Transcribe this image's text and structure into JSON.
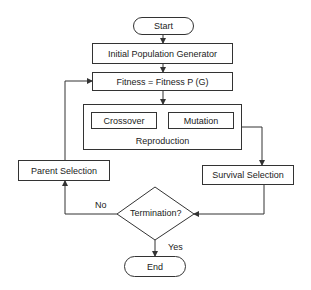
{
  "diagram": {
    "type": "flowchart",
    "nodes": {
      "start": "Start",
      "init_pop": "Initial Population Generator",
      "fitness": "Fitness = Fitness P (G)",
      "crossover": "Crossover",
      "mutation": "Mutation",
      "reproduction": "Reproduction",
      "survival": "Survival Selection",
      "termination": "Termination?",
      "parent": "Parent Selection",
      "end": "End"
    },
    "edge_labels": {
      "no": "No",
      "yes": "Yes"
    },
    "colors": {
      "stroke": "#333333",
      "background": "#ffffff",
      "text": "#222222"
    }
  }
}
